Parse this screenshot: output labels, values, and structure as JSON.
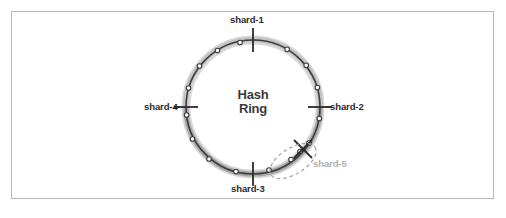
{
  "figure": {
    "frame": {
      "border_color": "#b9b9b9",
      "background": "#ffffff"
    }
  },
  "center": {
    "line1": "Hash",
    "line2": "Ring"
  },
  "ring": {
    "center_x": 253,
    "center_y": 107,
    "radius": 67,
    "stroke_color": "#3d3d3d",
    "shadow_color": "#bdbdbd",
    "node_count": 16,
    "node_fill": "#ffffff",
    "node_stroke": "#3d3d3d"
  },
  "shards": [
    {
      "id": "shard-1",
      "label": "shard-1",
      "angle_deg": 270,
      "color": "#2b2b2b",
      "state": "active"
    },
    {
      "id": "shard-2",
      "label": "shard-2",
      "angle_deg": 0,
      "color": "#2b2b2b",
      "state": "active"
    },
    {
      "id": "shard-3",
      "label": "shard-3",
      "angle_deg": 90,
      "color": "#2b2b2b",
      "state": "active"
    },
    {
      "id": "shard-4",
      "label": "shard-4",
      "angle_deg": 180,
      "color": "#2b2b2b",
      "state": "active"
    },
    {
      "id": "shard-5",
      "label": "shard-5",
      "angle_deg": 45,
      "color": "#b0b0b0",
      "state": "new"
    }
  ],
  "highlight": {
    "type": "dashed-ellipse",
    "stroke_color": "#9a9a9a",
    "encircles": "shard-5-range",
    "center_x": 293,
    "center_y": 161,
    "rx": 26,
    "ry": 13,
    "rotation_deg": -32
  },
  "nodes": {
    "marker_shape": "hexagon",
    "count": 16
  }
}
